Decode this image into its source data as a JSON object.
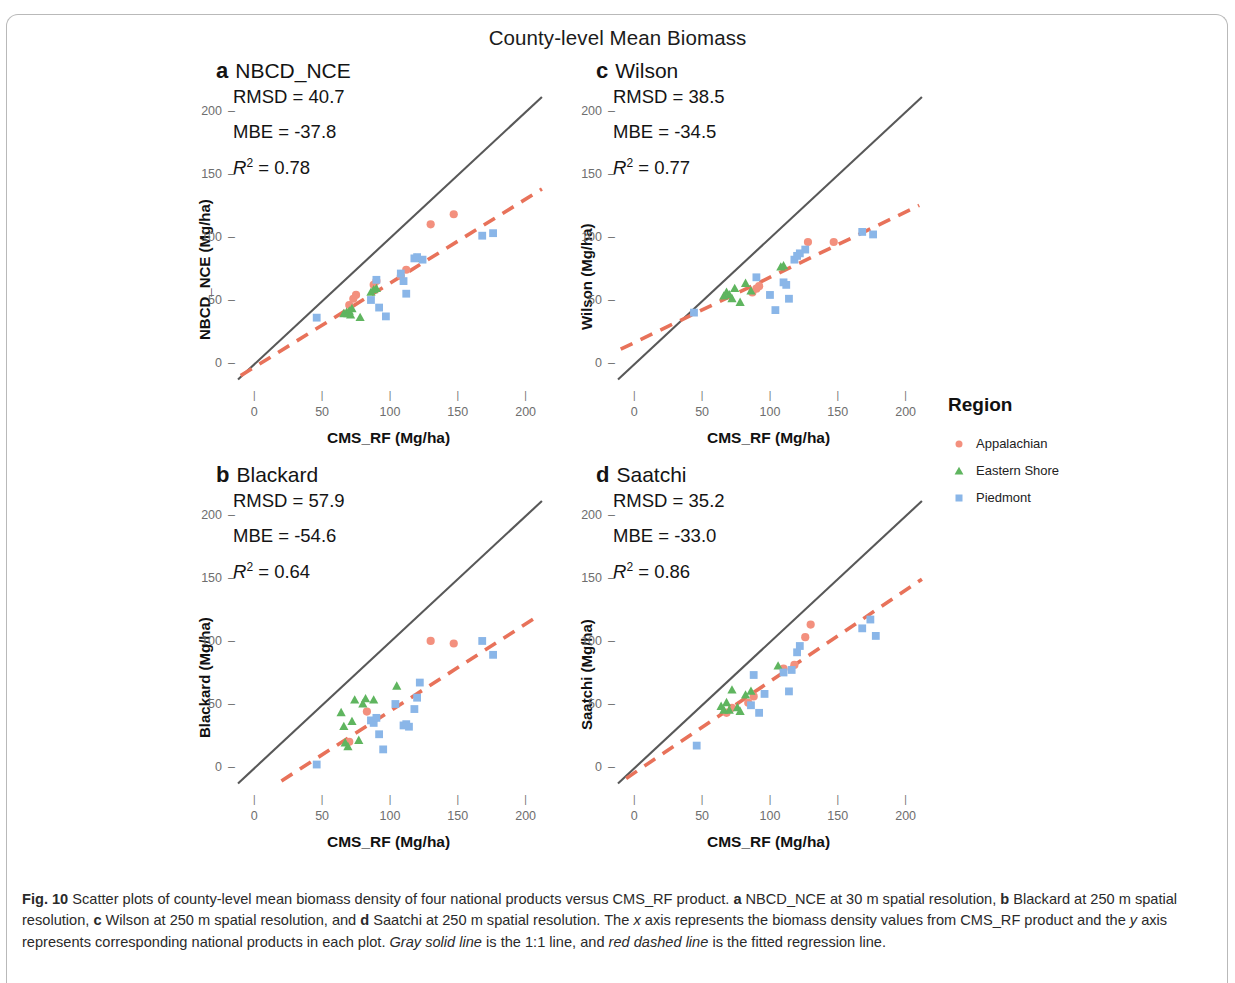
{
  "figure": {
    "title": "County-level Mean Biomass",
    "legend_title": "Region"
  },
  "legend": {
    "title": "Region",
    "items": [
      {
        "label": "Appalachian",
        "color": "#f3907e",
        "shape": "circle"
      },
      {
        "label": "Eastern Shore",
        "color": "#5fb55f",
        "shape": "triangle"
      },
      {
        "label": "Piedmont",
        "color": "#8ab6e8",
        "shape": "square"
      }
    ]
  },
  "axes": {
    "xlabel": "CMS_RF (Mg/ha)",
    "xticks": [
      0,
      50,
      100,
      150,
      200
    ],
    "yticks": [
      0,
      50,
      100,
      150,
      200
    ],
    "xlim": [
      -12,
      215
    ],
    "ylim": [
      -18,
      212
    ]
  },
  "caption": {
    "figure_number": "Fig. 10",
    "text_1": " Scatter plots of county-level mean biomass density of four national products versus CMS_RF product. ",
    "a_letter": "a",
    "text_a": " NBCD_NCE at 30 m spatial resolution, ",
    "b_letter": "b",
    "text_b": " Blackard at 250 m spatial resolution, ",
    "c_letter": "c",
    "text_c": " Wilson at 250 m spatial resolution, and ",
    "d_letter": "d",
    "text_d": " Saatchi at 250 m spatial resolution. The ",
    "x_italic": "x",
    "text_e": " axis represents the biomass density values from CMS_RF product and the ",
    "y_italic": "y",
    "text_f": " axis represents corresponding national products in each plot. ",
    "gray_italic": "Gray solid line",
    "text_g": " is the 1:1 line, and ",
    "red_italic": "red dashed line",
    "text_h": " is the fitted regression line."
  },
  "colors": {
    "one_to_one_line": "#585858",
    "regression_line": "#e8725a",
    "appalachian": "#f3907e",
    "eastern_shore": "#5fb55f",
    "piedmont": "#8ab6e8"
  },
  "chart_data": [
    {
      "panel": "a",
      "type": "scatter",
      "title": "NBCD_NCE",
      "ylabel": "NBCD_NCE (Mg/ha)",
      "xlabel": "CMS_RF (Mg/ha)",
      "stats": {
        "RMSD": "40.7",
        "MBE": "-37.8",
        "R2": "0.78"
      },
      "rmsd_label": "RMSD = 40.7",
      "mbe_label": "MBE = -37.8",
      "r2_value": "0.78",
      "xlim": [
        -12,
        215
      ],
      "ylim": [
        -18,
        212
      ],
      "one_to_one": {
        "x0": -12,
        "y0": -12,
        "x1": 212,
        "y1": 212
      },
      "regression": {
        "x0": -10,
        "y0": -9,
        "x1": 212,
        "y1": 139
      },
      "series": [
        {
          "name": "Appalachian",
          "color": "#f3907e",
          "shape": "circle",
          "points": [
            [
              70,
              47
            ],
            [
              73,
              52
            ],
            [
              75,
              55
            ],
            [
              88,
              63
            ],
            [
              90,
              66
            ],
            [
              108,
              70
            ],
            [
              112,
              75
            ],
            [
              130,
              111
            ],
            [
              147,
              119
            ]
          ]
        },
        {
          "name": "Eastern Shore",
          "color": "#5fb55f",
          "shape": "triangle",
          "points": [
            [
              66,
              40
            ],
            [
              68,
              41
            ],
            [
              69,
              40
            ],
            [
              70,
              42
            ],
            [
              71,
              39
            ],
            [
              72,
              44
            ],
            [
              78,
              37
            ],
            [
              86,
              57
            ],
            [
              88,
              59
            ],
            [
              90,
              60
            ],
            [
              119,
              84
            ]
          ]
        },
        {
          "name": "Piedmont",
          "color": "#8ab6e8",
          "shape": "square",
          "points": [
            [
              46,
              37
            ],
            [
              86,
              51
            ],
            [
              90,
              67
            ],
            [
              92,
              45
            ],
            [
              97,
              38
            ],
            [
              108,
              72
            ],
            [
              110,
              66
            ],
            [
              112,
              56
            ],
            [
              118,
              84
            ],
            [
              120,
              85
            ],
            [
              124,
              83
            ],
            [
              168,
              102
            ],
            [
              176,
              104
            ]
          ]
        }
      ]
    },
    {
      "panel": "b",
      "type": "scatter",
      "title": "Blackard",
      "ylabel": "Blackard (Mg/ha)",
      "xlabel": "CMS_RF (Mg/ha)",
      "stats": {
        "RMSD": "57.9",
        "MBE": "-54.6",
        "R2": "0.64"
      },
      "rmsd_label": "RMSD = 57.9",
      "mbe_label": "MBE = -54.6",
      "r2_value": "0.64",
      "xlim": [
        -12,
        215
      ],
      "ylim": [
        -18,
        212
      ],
      "one_to_one": {
        "x0": -12,
        "y0": -12,
        "x1": 212,
        "y1": 212
      },
      "regression": {
        "x0": 20,
        "y0": -10,
        "x1": 208,
        "y1": 120
      },
      "series": [
        {
          "name": "Appalachian",
          "color": "#f3907e",
          "shape": "circle",
          "points": [
            [
              70,
              21
            ],
            [
              83,
              45
            ],
            [
              130,
              101
            ],
            [
              147,
              99
            ]
          ]
        },
        {
          "name": "Eastern Shore",
          "color": "#5fb55f",
          "shape": "triangle",
          "points": [
            [
              64,
              44
            ],
            [
              66,
              33
            ],
            [
              67,
              20
            ],
            [
              69,
              17
            ],
            [
              72,
              37
            ],
            [
              74,
              54
            ],
            [
              77,
              22
            ],
            [
              80,
              51
            ],
            [
              82,
              55
            ],
            [
              88,
              54
            ],
            [
              105,
              65
            ]
          ]
        },
        {
          "name": "Piedmont",
          "color": "#8ab6e8",
          "shape": "square",
          "points": [
            [
              46,
              3
            ],
            [
              86,
              38
            ],
            [
              88,
              36
            ],
            [
              90,
              40
            ],
            [
              92,
              27
            ],
            [
              95,
              15
            ],
            [
              104,
              51
            ],
            [
              110,
              34
            ],
            [
              112,
              35
            ],
            [
              114,
              33
            ],
            [
              118,
              47
            ],
            [
              120,
              56
            ],
            [
              122,
              68
            ],
            [
              168,
              101
            ],
            [
              176,
              90
            ]
          ]
        }
      ]
    },
    {
      "panel": "c",
      "type": "scatter",
      "title": "Wilson",
      "ylabel": "Wilson (Mg/ha)",
      "xlabel": "CMS_RF (Mg/ha)",
      "stats": {
        "RMSD": "38.5",
        "MBE": "-34.5",
        "R2": "0.77"
      },
      "rmsd_label": "RMSD = 38.5",
      "mbe_label": "MBE = -34.5",
      "r2_value": "0.77",
      "xlim": [
        -12,
        215
      ],
      "ylim": [
        -18,
        212
      ],
      "one_to_one": {
        "x0": -12,
        "y0": -12,
        "x1": 212,
        "y1": 212
      },
      "regression": {
        "x0": -10,
        "y0": 12,
        "x1": 210,
        "y1": 126
      },
      "series": [
        {
          "name": "Appalachian",
          "color": "#f3907e",
          "shape": "circle",
          "points": [
            [
              87,
              57
            ],
            [
              90,
              60
            ],
            [
              92,
              62
            ],
            [
              128,
              97
            ],
            [
              147,
              97
            ]
          ]
        },
        {
          "name": "Eastern Shore",
          "color": "#5fb55f",
          "shape": "triangle",
          "points": [
            [
              66,
              54
            ],
            [
              68,
              57
            ],
            [
              70,
              55
            ],
            [
              72,
              52
            ],
            [
              74,
              60
            ],
            [
              78,
              49
            ],
            [
              82,
              64
            ],
            [
              86,
              58
            ],
            [
              108,
              77
            ],
            [
              110,
              78
            ]
          ]
        },
        {
          "name": "Piedmont",
          "color": "#8ab6e8",
          "shape": "square",
          "points": [
            [
              44,
              41
            ],
            [
              90,
              69
            ],
            [
              100,
              55
            ],
            [
              104,
              43
            ],
            [
              110,
              65
            ],
            [
              112,
              63
            ],
            [
              114,
              52
            ],
            [
              118,
              83
            ],
            [
              120,
              86
            ],
            [
              122,
              88
            ],
            [
              126,
              91
            ],
            [
              168,
              105
            ],
            [
              176,
              103
            ]
          ]
        }
      ]
    },
    {
      "panel": "d",
      "type": "scatter",
      "title": "Saatchi",
      "ylabel": "Saatchi (Mg/ha)",
      "xlabel": "CMS_RF (Mg/ha)",
      "stats": {
        "RMSD": "35.2",
        "MBE": "-33.0",
        "R2": "0.86"
      },
      "rmsd_label": "RMSD = 35.2",
      "mbe_label": "MBE = -33.0",
      "r2_value": "0.86",
      "xlim": [
        -12,
        215
      ],
      "ylim": [
        -18,
        212
      ],
      "one_to_one": {
        "x0": -12,
        "y0": -12,
        "x1": 212,
        "y1": 212
      },
      "regression": {
        "x0": -6,
        "y0": -8,
        "x1": 212,
        "y1": 150
      },
      "series": [
        {
          "name": "Appalachian",
          "color": "#f3907e",
          "shape": "circle",
          "points": [
            [
              68,
              44
            ],
            [
              72,
              48
            ],
            [
              84,
              52
            ],
            [
              88,
              57
            ],
            [
              110,
              79
            ],
            [
              118,
              82
            ],
            [
              126,
              104
            ],
            [
              130,
              114
            ]
          ]
        },
        {
          "name": "Eastern Shore",
          "color": "#5fb55f",
          "shape": "triangle",
          "points": [
            [
              64,
              49
            ],
            [
              66,
              46
            ],
            [
              68,
              52
            ],
            [
              70,
              46
            ],
            [
              72,
              62
            ],
            [
              76,
              48
            ],
            [
              78,
              45
            ],
            [
              82,
              58
            ],
            [
              86,
              61
            ],
            [
              106,
              81
            ]
          ]
        },
        {
          "name": "Piedmont",
          "color": "#8ab6e8",
          "shape": "square",
          "points": [
            [
              46,
              18
            ],
            [
              86,
              50
            ],
            [
              88,
              74
            ],
            [
              92,
              44
            ],
            [
              96,
              59
            ],
            [
              110,
              76
            ],
            [
              114,
              61
            ],
            [
              116,
              78
            ],
            [
              120,
              92
            ],
            [
              122,
              97
            ],
            [
              168,
              111
            ],
            [
              174,
              118
            ],
            [
              178,
              105
            ]
          ]
        }
      ]
    }
  ]
}
